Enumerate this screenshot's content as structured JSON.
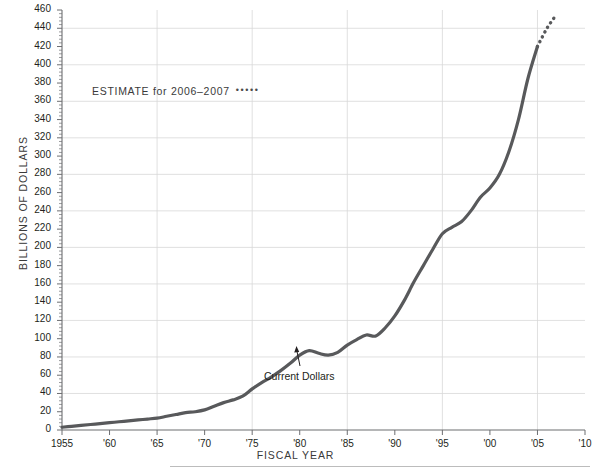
{
  "chart_data": {
    "type": "line",
    "title": "",
    "xlabel": "FISCAL YEAR",
    "ylabel": "BILLIONS OF DOLLARS",
    "xlim": [
      1955,
      2010
    ],
    "ylim": [
      0,
      460
    ],
    "ytick_step": 20,
    "ygrid_step": 40,
    "grid": true,
    "legend_position": "none",
    "xticks": [
      "1955",
      "'60",
      "'65",
      "'70",
      "'75",
      "'80",
      "'85",
      "'90",
      "'95",
      "'00",
      "'05",
      "'10"
    ],
    "xtick_values": [
      1955,
      1960,
      1965,
      1970,
      1975,
      1980,
      1985,
      1990,
      1995,
      2000,
      2005,
      2010
    ],
    "yticks": [
      0,
      20,
      40,
      60,
      80,
      100,
      120,
      140,
      160,
      180,
      200,
      220,
      240,
      260,
      280,
      300,
      320,
      340,
      360,
      380,
      400,
      420,
      440,
      460
    ],
    "ytick_labels": [
      "0",
      "20",
      "40",
      "60",
      "80",
      "100",
      "120",
      "140",
      "160",
      "180",
      "200",
      "220",
      "240",
      "260",
      "280",
      "300",
      "320",
      "340",
      "360",
      "380",
      "400",
      "420",
      "440",
      "460"
    ],
    "series": [
      {
        "name": "Current Dollars",
        "style": "solid",
        "color": "#58595b",
        "x": [
          1955,
          1956,
          1957,
          1958,
          1959,
          1960,
          1961,
          1962,
          1963,
          1964,
          1965,
          1966,
          1967,
          1968,
          1969,
          1970,
          1971,
          1972,
          1973,
          1974,
          1975,
          1976,
          1977,
          1978,
          1979,
          1980,
          1981,
          1982,
          1983,
          1984,
          1985,
          1986,
          1987,
          1988,
          1989,
          1990,
          1991,
          1992,
          1993,
          1994,
          1995,
          1996,
          1997,
          1998,
          1999,
          2000,
          2001,
          2002,
          2003,
          2004,
          2005
        ],
        "values": [
          3,
          4,
          5,
          6,
          7,
          8,
          9,
          10,
          11,
          12,
          13,
          15,
          17,
          19,
          20,
          22,
          26,
          30,
          33,
          37,
          45,
          52,
          58,
          65,
          73,
          82,
          87,
          84,
          82,
          85,
          93,
          99,
          104,
          103,
          112,
          125,
          142,
          162,
          180,
          198,
          215,
          222,
          228,
          240,
          255,
          265,
          280,
          305,
          340,
          385,
          420
        ]
      },
      {
        "name": "ESTIMATE for 2006–2007",
        "style": "dotted",
        "color": "#58595b",
        "x": [
          2005,
          2006,
          2007
        ],
        "values": [
          420,
          440,
          455
        ]
      }
    ],
    "annotations": [
      {
        "text": "ESTIMATE for 2006–2007",
        "kind": "legend-note",
        "x": 1965,
        "y": 383
      },
      {
        "text": "Current Dollars",
        "kind": "series-callout",
        "x": 1981,
        "y": 55,
        "points_to": {
          "x": 1981,
          "y": 87
        }
      }
    ]
  },
  "labels": {
    "y_axis_title": "BILLIONS OF DOLLARS",
    "x_axis_title": "FISCAL YEAR",
    "estimate_note": "ESTIMATE for 2006–2007",
    "estimate_dots": "•••••",
    "series_callout": "Current Dollars"
  },
  "colors": {
    "line": "#58595b",
    "grid": "#d8d8d8",
    "axis": "#6d6e71",
    "text": "#231f20",
    "background": "#ffffff"
  }
}
